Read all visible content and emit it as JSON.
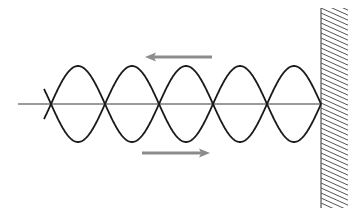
{
  "diagram": {
    "axis": {
      "x1": 18,
      "x2": 321,
      "y": 104,
      "color": "#7a7a7a"
    },
    "wave": {
      "nodes_x": [
        51,
        105,
        159,
        213,
        267,
        321
      ],
      "center_y": 104,
      "amplitude": 38,
      "loops": 5,
      "color": "#1a1a1a",
      "left_extension": 7
    },
    "arrows": [
      {
        "name": "incident-direction",
        "direction": "left",
        "x_from": 212,
        "x_to": 145,
        "y": 57,
        "color": "#8c8c8c"
      },
      {
        "name": "reflected-direction",
        "direction": "right",
        "x_from": 142,
        "x_to": 210,
        "y": 153,
        "color": "#8c8c8c"
      }
    ],
    "wall": {
      "x": 321,
      "y_top": 8,
      "y_bottom": 208,
      "hatch_width": 27,
      "hatch_spacing": 5,
      "color": "#555555"
    }
  }
}
